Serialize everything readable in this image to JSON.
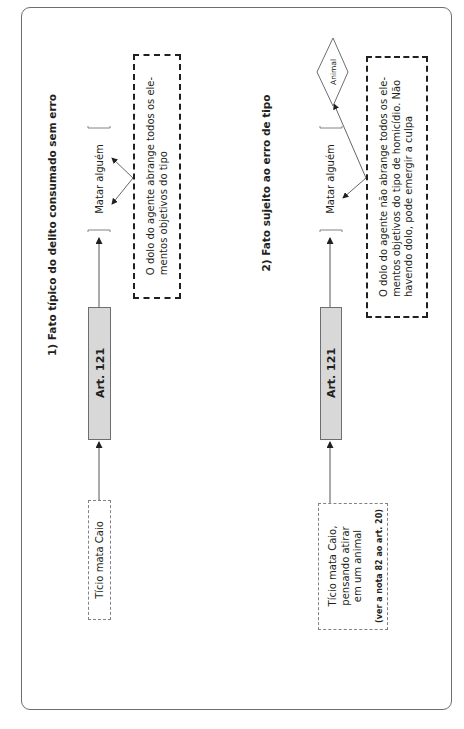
{
  "diagram": {
    "section1": {
      "title": "1) Fato típico do delito consumado sem erro",
      "fact": "Tício mata Caio",
      "article": "Art. 121",
      "element": "Matar alguém",
      "note_line1": "O dolo do agente abrange todos os ele-",
      "note_line2": "mentos objetivos do tipo"
    },
    "section2": {
      "title": "2) Fato sujeito ao erro de tipo",
      "fact_line1": "Tício mata Caio,",
      "fact_line2": "pensando atirar",
      "fact_line3": "em um animal",
      "fact_ref": "(ver a nota 82 ao art. 20)",
      "article": "Art. 121",
      "element": "Matar alguém",
      "diamond": "Animal",
      "note_line1": "O dolo do agente não abrange todos os ele-",
      "note_line2": "mentos objetivos do tipo de homicídio. Não",
      "note_line3": "havendo dolo, pode emergir a culpa"
    },
    "colors": {
      "art_box_fill": "#d8d8d8",
      "frame": "#6d6e71",
      "text": "#231f20"
    }
  }
}
